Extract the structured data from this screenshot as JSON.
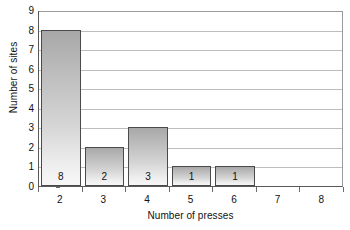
{
  "chart_data": {
    "type": "bar",
    "title": "",
    "subtitle": "",
    "xlabel": "Number of presses",
    "ylabel": "Number of sites",
    "categories": [
      "2",
      "3",
      "4",
      "5",
      "6",
      "7",
      "8"
    ],
    "values": [
      8,
      2,
      3,
      1,
      1,
      0,
      0
    ],
    "bar_labels": [
      "8",
      "2",
      "3",
      "1",
      "1",
      "",
      ""
    ],
    "xlim": [
      1.5,
      8.5
    ],
    "ylim": [
      0,
      9
    ],
    "x_ticks": [
      "1.5",
      "2.5",
      "3.5",
      "4.5",
      "5.5",
      "6.5",
      "7.5",
      "8.5"
    ],
    "y_ticks": [
      "0",
      "1",
      "2",
      "3",
      "4",
      "5",
      "6",
      "7",
      "8",
      "9"
    ],
    "grid": "horizontal",
    "legend": "none",
    "bar_fill_top": "#a8a8a8",
    "bar_fill_bottom": "#f7f7f7",
    "bar_border_color": "#4a4a4a",
    "gridline_color": "#bdbdbd",
    "axis_color": "#595959",
    "background_color": "#ffffff",
    "annotations": []
  }
}
